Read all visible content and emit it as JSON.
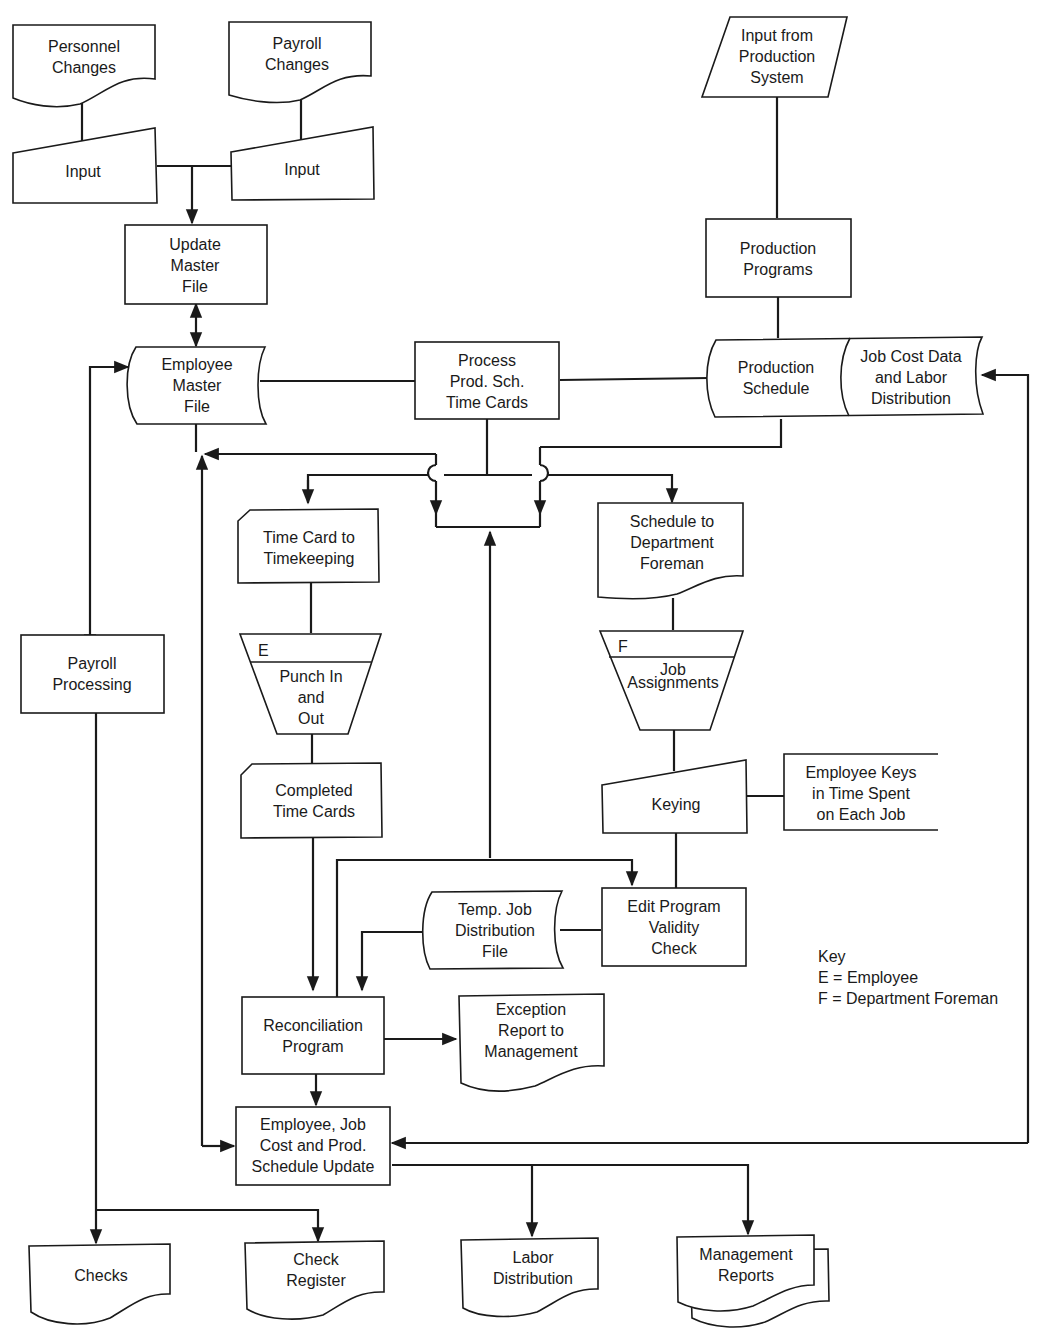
{
  "diagram": {
    "type": "system flowchart",
    "nodes": {
      "personnel_changes": {
        "shape": "document",
        "lines": [
          "Personnel",
          "Changes"
        ]
      },
      "payroll_changes": {
        "shape": "document",
        "lines": [
          "Payroll",
          "Changes"
        ]
      },
      "input_left": {
        "shape": "manual-input",
        "lines": [
          "Input"
        ]
      },
      "input_right": {
        "shape": "manual-input",
        "lines": [
          "Input"
        ]
      },
      "update_master_file": {
        "shape": "process",
        "lines": [
          "Update",
          "Master",
          "File"
        ]
      },
      "input_from_production": {
        "shape": "input-output",
        "lines": [
          "Input from",
          "Production",
          "System"
        ]
      },
      "production_programs": {
        "shape": "process",
        "lines": [
          "Production",
          "Programs"
        ]
      },
      "employee_master_file": {
        "shape": "stored-data",
        "lines": [
          "Employee",
          "Master",
          "File"
        ]
      },
      "process_prod_sch": {
        "shape": "process",
        "lines": [
          "Process",
          "Prod. Sch.",
          "Time Cards"
        ]
      },
      "production_schedule": {
        "shape": "stored-data",
        "lines": [
          "Production",
          "Schedule"
        ]
      },
      "job_cost_data": {
        "shape": "stored-data",
        "lines": [
          "Job Cost Data",
          "and Labor",
          "Distribution"
        ]
      },
      "time_card_to_timekeeping": {
        "shape": "card",
        "lines": [
          "Time Card to",
          "Timekeeping"
        ]
      },
      "schedule_to_foreman": {
        "shape": "document",
        "lines": [
          "Schedule to",
          "Department",
          "Foreman"
        ]
      },
      "payroll_processing": {
        "shape": "process",
        "lines": [
          "Payroll",
          "Processing"
        ]
      },
      "punch_in_out": {
        "shape": "manual-operation",
        "tag": "E",
        "lines": [
          "Punch In",
          "and",
          "Out"
        ]
      },
      "job_assignments": {
        "shape": "manual-operation",
        "tag": "F",
        "lines": [
          "Job",
          "Assignments"
        ]
      },
      "completed_time_cards": {
        "shape": "card",
        "lines": [
          "Completed",
          "Time Cards"
        ]
      },
      "keying": {
        "shape": "manual-input",
        "lines": [
          "Keying"
        ]
      },
      "employee_keys_annotation": {
        "shape": "annotation",
        "lines": [
          "Employee Keys",
          "in Time Spent",
          "on Each Job"
        ]
      },
      "temp_job_distribution": {
        "shape": "stored-data",
        "lines": [
          "Temp. Job",
          "Distribution",
          "File"
        ]
      },
      "edit_program": {
        "shape": "process",
        "lines": [
          "Edit Program",
          "Validity",
          "Check"
        ]
      },
      "reconciliation_program": {
        "shape": "process",
        "lines": [
          "Reconciliation",
          "Program"
        ]
      },
      "exception_report": {
        "shape": "document",
        "lines": [
          "Exception",
          "Report to",
          "Management"
        ]
      },
      "update_program": {
        "shape": "process",
        "lines": [
          "Employee, Job",
          "Cost and Prod.",
          "Schedule Update"
        ]
      },
      "checks": {
        "shape": "document",
        "lines": [
          "Checks"
        ]
      },
      "check_register": {
        "shape": "document",
        "lines": [
          "Check",
          "Register"
        ]
      },
      "labor_distribution": {
        "shape": "document",
        "lines": [
          "Labor",
          "Distribution"
        ]
      },
      "management_reports": {
        "shape": "multi-document",
        "lines": [
          "Management",
          "Reports"
        ]
      }
    },
    "key": {
      "title": "Key",
      "entries": [
        "E = Employee",
        "F = Department Foreman"
      ]
    }
  }
}
